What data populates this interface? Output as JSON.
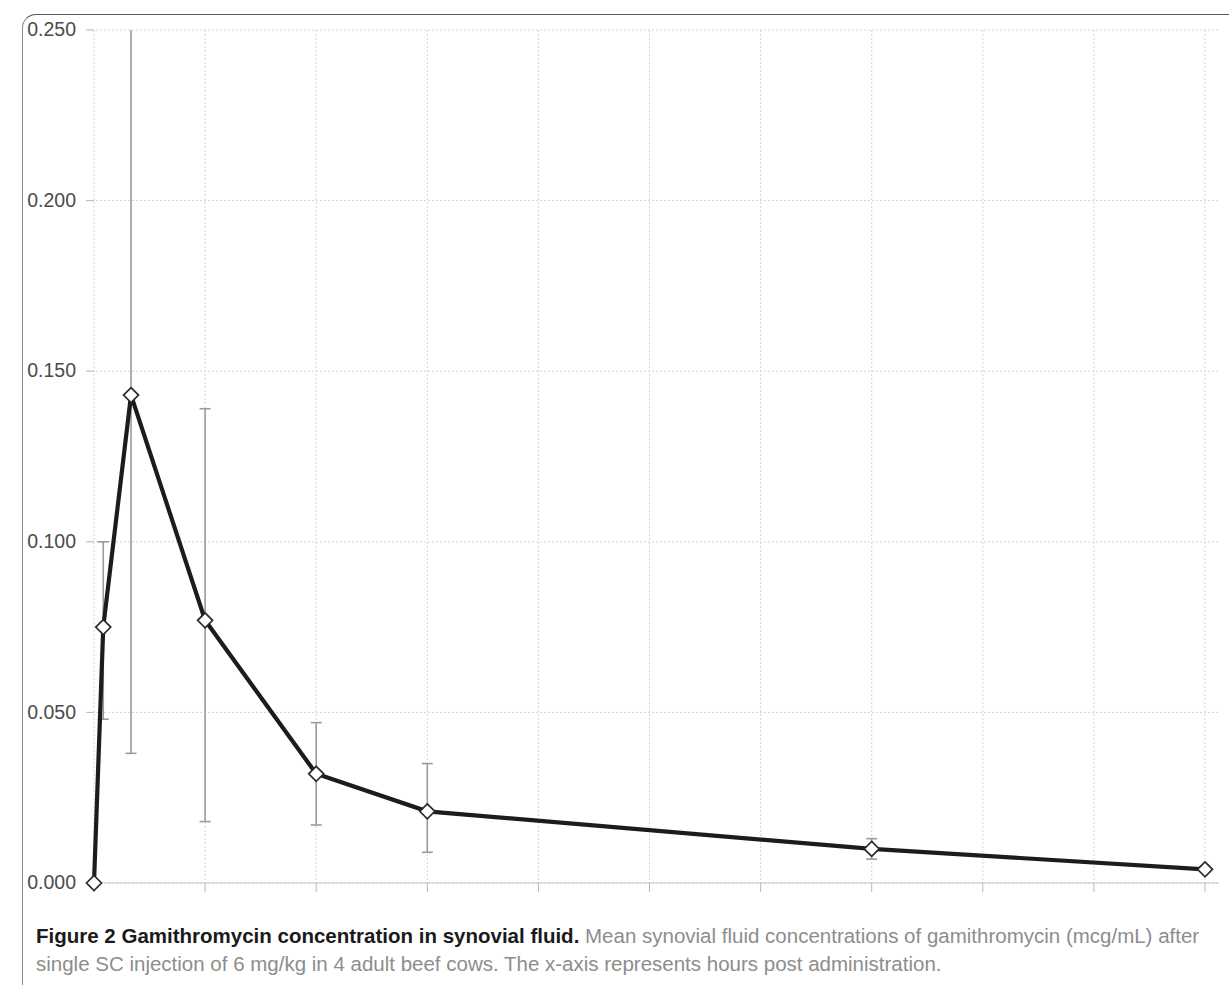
{
  "figure": {
    "caption_title": "Figure 2 Gamithromycin concentration in synovial fluid.",
    "caption_body": " Mean synovial fluid concentrations of gamithromycin (mcg/mL) after single SC injection of 6 mg/kg in 4 adult beef cows. The x-axis represents hours post administration."
  },
  "chart_data": {
    "type": "line",
    "title": "",
    "xlabel": "",
    "ylabel": "",
    "xlim": [
      0,
      240
    ],
    "ylim": [
      0.0,
      0.25
    ],
    "xticks": [
      0,
      24,
      48,
      72,
      96,
      120,
      144,
      168,
      192,
      216,
      240
    ],
    "xtick_labels": [
      "0",
      "24",
      "48",
      "72",
      "96",
      "120",
      "144",
      "168",
      "192",
      "216",
      "240"
    ],
    "yticks": [
      0.0,
      0.05,
      0.1,
      0.15,
      0.2,
      0.25
    ],
    "ytick_labels": [
      "0.000",
      "0.050",
      "0.100",
      "0.150",
      "0.200",
      "0.250"
    ],
    "grid": true,
    "grid_axis": "both",
    "legend": false,
    "marker": "diamond",
    "series": [
      {
        "name": "Gamithromycin synovial fluid concentration",
        "x": [
          0,
          2,
          8,
          24,
          48,
          72,
          168,
          240
        ],
        "values": [
          0.0,
          0.075,
          0.143,
          0.077,
          0.032,
          0.021,
          0.01,
          0.004
        ],
        "error_low": [
          0.0,
          0.048,
          0.038,
          0.018,
          0.017,
          0.009,
          0.007,
          0.004
        ],
        "error_high": [
          0.0,
          0.1,
          0.26,
          0.139,
          0.047,
          0.035,
          0.013,
          0.004
        ]
      }
    ]
  },
  "colors": {
    "line": "#1c1c1c",
    "errorbar": "#9b9b9b",
    "grid": "#d5d5d5",
    "tick_text": "#4b4b4b",
    "caption_title": "#1a1a1a",
    "caption_body": "#8d8d8d",
    "background": "#ffffff"
  }
}
